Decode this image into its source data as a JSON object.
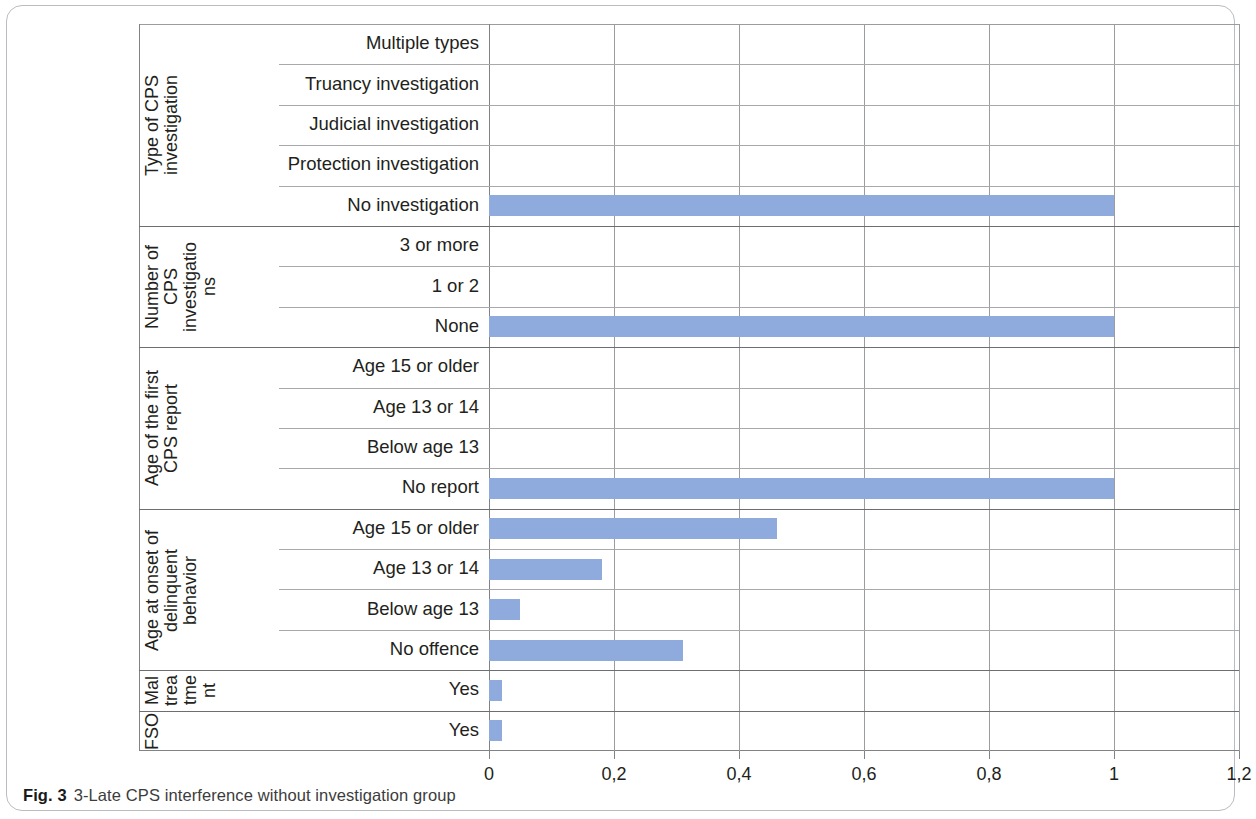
{
  "caption": {
    "label": "Fig. 3",
    "text": "3-Late CPS interference without investigation group"
  },
  "colors": {
    "bar": "#8faadc",
    "grid": "#9a9ca0",
    "axis": "#808285",
    "text": "#231f20",
    "card_border": "#b9bcc0"
  },
  "chart_data": {
    "type": "bar",
    "orientation": "horizontal",
    "title": "3-Late CPS interference without investigation group",
    "xlabel": "",
    "ylabel": "",
    "xlim": [
      0,
      1.2
    ],
    "grid": true,
    "legend": false,
    "decimal_separator": ",",
    "xticks": [
      0,
      0.2,
      0.4,
      0.6,
      0.8,
      1,
      1.2
    ],
    "xticklabels": [
      "0",
      "0,2",
      "0,4",
      "0,6",
      "0,8",
      "1",
      "1,2"
    ],
    "groups": [
      {
        "title": "Type of CPS investigation",
        "title_lines": [
          "Type of CPS",
          "investigation"
        ],
        "categories": [
          "Multiple types",
          "Truancy investigation",
          "Judicial investigation",
          "Protection investigation",
          "No investigation"
        ],
        "values": [
          0,
          0,
          0,
          0,
          1.0
        ]
      },
      {
        "title": "Number of CPS investigations",
        "title_lines": [
          "Number of",
          "CPS",
          "investigatio",
          "ns"
        ],
        "categories": [
          "3 or more",
          "1 or 2",
          "None"
        ],
        "values": [
          0,
          0,
          1.0
        ]
      },
      {
        "title": "Age of the first CPS report",
        "title_lines": [
          "Age of the first",
          "CPS report"
        ],
        "categories": [
          "Age 15 or older",
          "Age 13 or 14",
          "Below age 13",
          "No report"
        ],
        "values": [
          0,
          0,
          0,
          1.0
        ]
      },
      {
        "title": "Age at onset of delinquent behavior",
        "title_lines": [
          "Age at onset of",
          "delinquent",
          "behavior"
        ],
        "categories": [
          "Age 15 or older",
          "Age 13 or 14",
          "Below age 13",
          "No offence"
        ],
        "values": [
          0.46,
          0.18,
          0.05,
          0.31
        ]
      },
      {
        "title": "Maltreatment",
        "title_lines": [
          "Mal",
          "trea",
          "tme",
          "nt"
        ],
        "categories": [
          "Yes"
        ],
        "values": [
          0.02
        ]
      },
      {
        "title": "FSO",
        "title_lines": [
          "FSO"
        ],
        "categories": [
          "Yes"
        ],
        "values": [
          0.02
        ]
      }
    ]
  }
}
